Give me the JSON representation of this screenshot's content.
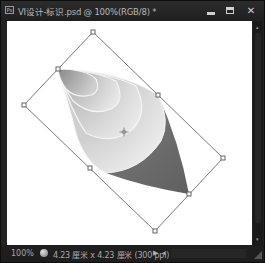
{
  "window": {
    "app_icon_label": "Ps",
    "title": "VI设计-标识.psd @ 100%(RGB/8) *",
    "controls": {
      "minimize": "minimize-icon",
      "maximize": "maximize-icon",
      "close": "close-icon",
      "close_glyph": "✕"
    }
  },
  "canvas": {
    "background": "#ffffff",
    "artwork": "rotated cone shape with concentric gray gradient arcs",
    "transform_box": {
      "active": true,
      "handle_count": 8,
      "center_marker": "reference-point-icon",
      "line_color": "#6b6b6b"
    },
    "shape_colors": {
      "light": "#e8e8e8",
      "mid": "#b5b5b5",
      "dark": "#6f6f6f"
    }
  },
  "statusbar": {
    "zoom": "100%",
    "doc_info": "4.23 厘米 x 4.23 厘米 (300 ppi)",
    "menu_arrow": "▶",
    "nav_arrow": "◂"
  },
  "scrollbar": {
    "up_arrow": "▴",
    "down_arrow": "▾"
  }
}
